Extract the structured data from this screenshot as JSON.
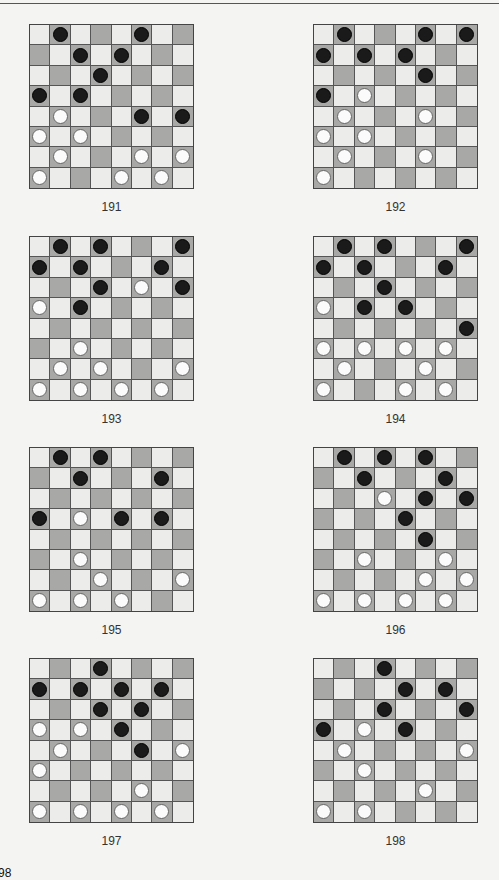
{
  "page": {
    "page_number_partial": "98"
  },
  "colors": {
    "light_square": "#ececea",
    "dark_square": "#a8a8a6",
    "black_piece": "#1a1a1a",
    "white_piece": "#fbfbfb"
  },
  "diagrams": [
    {
      "label": "191",
      "black": [
        [
          0,
          1
        ],
        [
          0,
          5
        ],
        [
          1,
          2
        ],
        [
          1,
          4
        ],
        [
          2,
          3
        ],
        [
          3,
          0
        ],
        [
          3,
          2
        ],
        [
          4,
          5
        ],
        [
          4,
          7
        ]
      ],
      "white": [
        [
          4,
          1
        ],
        [
          5,
          0
        ],
        [
          5,
          2
        ],
        [
          6,
          1
        ],
        [
          6,
          5
        ],
        [
          6,
          7
        ],
        [
          7,
          0
        ],
        [
          7,
          4
        ],
        [
          7,
          6
        ]
      ]
    },
    {
      "label": "192",
      "black": [
        [
          0,
          1
        ],
        [
          0,
          5
        ],
        [
          0,
          7
        ],
        [
          1,
          0
        ],
        [
          1,
          2
        ],
        [
          1,
          4
        ],
        [
          2,
          5
        ],
        [
          3,
          0
        ]
      ],
      "white": [
        [
          3,
          2
        ],
        [
          4,
          1
        ],
        [
          4,
          5
        ],
        [
          5,
          0
        ],
        [
          5,
          2
        ],
        [
          6,
          1
        ],
        [
          6,
          5
        ],
        [
          7,
          0
        ]
      ]
    },
    {
      "label": "193",
      "black": [
        [
          0,
          1
        ],
        [
          0,
          3
        ],
        [
          0,
          7
        ],
        [
          1,
          0
        ],
        [
          1,
          2
        ],
        [
          1,
          6
        ],
        [
          2,
          3
        ],
        [
          2,
          7
        ],
        [
          3,
          2
        ]
      ],
      "white": [
        [
          2,
          5
        ],
        [
          3,
          0
        ],
        [
          5,
          2
        ],
        [
          6,
          1
        ],
        [
          6,
          3
        ],
        [
          6,
          7
        ],
        [
          7,
          0
        ],
        [
          7,
          2
        ],
        [
          7,
          4
        ],
        [
          7,
          6
        ]
      ]
    },
    {
      "label": "194",
      "black": [
        [
          0,
          1
        ],
        [
          0,
          3
        ],
        [
          0,
          7
        ],
        [
          1,
          0
        ],
        [
          1,
          2
        ],
        [
          1,
          6
        ],
        [
          2,
          3
        ],
        [
          3,
          2
        ],
        [
          3,
          4
        ],
        [
          4,
          7
        ]
      ],
      "white": [
        [
          3,
          0
        ],
        [
          5,
          0
        ],
        [
          5,
          2
        ],
        [
          5,
          4
        ],
        [
          5,
          6
        ],
        [
          6,
          1
        ],
        [
          6,
          5
        ],
        [
          7,
          0
        ],
        [
          7,
          4
        ],
        [
          7,
          6
        ]
      ]
    },
    {
      "label": "195",
      "black": [
        [
          0,
          1
        ],
        [
          0,
          3
        ],
        [
          1,
          2
        ],
        [
          1,
          6
        ],
        [
          3,
          0
        ],
        [
          3,
          4
        ],
        [
          3,
          6
        ]
      ],
      "white": [
        [
          3,
          2
        ],
        [
          5,
          2
        ],
        [
          6,
          3
        ],
        [
          6,
          7
        ],
        [
          7,
          0
        ],
        [
          7,
          2
        ],
        [
          7,
          4
        ]
      ]
    },
    {
      "label": "196",
      "black": [
        [
          0,
          1
        ],
        [
          0,
          3
        ],
        [
          0,
          5
        ],
        [
          1,
          2
        ],
        [
          1,
          6
        ],
        [
          2,
          5
        ],
        [
          2,
          7
        ],
        [
          3,
          4
        ],
        [
          4,
          5
        ]
      ],
      "white": [
        [
          2,
          3
        ],
        [
          5,
          2
        ],
        [
          5,
          6
        ],
        [
          6,
          5
        ],
        [
          6,
          7
        ],
        [
          7,
          0
        ],
        [
          7,
          2
        ],
        [
          7,
          4
        ],
        [
          7,
          6
        ]
      ]
    },
    {
      "label": "197",
      "black": [
        [
          0,
          3
        ],
        [
          1,
          0
        ],
        [
          1,
          2
        ],
        [
          1,
          4
        ],
        [
          1,
          6
        ],
        [
          2,
          3
        ],
        [
          2,
          5
        ],
        [
          3,
          4
        ],
        [
          4,
          5
        ]
      ],
      "white": [
        [
          3,
          0
        ],
        [
          3,
          2
        ],
        [
          4,
          1
        ],
        [
          4,
          7
        ],
        [
          5,
          0
        ],
        [
          6,
          5
        ],
        [
          7,
          0
        ],
        [
          7,
          2
        ],
        [
          7,
          4
        ],
        [
          7,
          6
        ]
      ]
    },
    {
      "label": "198",
      "black": [
        [
          0,
          3
        ],
        [
          1,
          4
        ],
        [
          1,
          6
        ],
        [
          2,
          3
        ],
        [
          2,
          7
        ],
        [
          3,
          0
        ],
        [
          3,
          4
        ]
      ],
      "white": [
        [
          3,
          2
        ],
        [
          4,
          1
        ],
        [
          4,
          7
        ],
        [
          5,
          2
        ],
        [
          6,
          5
        ],
        [
          7,
          0
        ],
        [
          7,
          2
        ]
      ]
    }
  ]
}
